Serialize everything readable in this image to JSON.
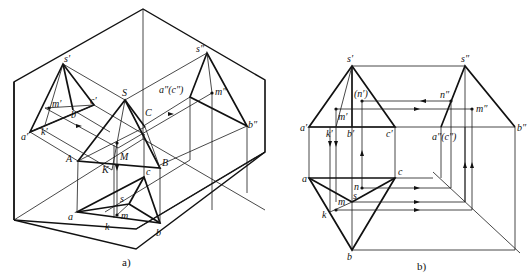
{
  "figure": {
    "panel_a": {
      "caption": "a)",
      "description": "Isometric view of three projection planes (V, H, W) with triangular pyramid SABC and its projections",
      "labels": {
        "s_prime": "s′",
        "s_double": "s″",
        "S": "S",
        "C": "C",
        "a_dbl_c_dbl": "a″(c″)",
        "m_prime": "m′",
        "c_prime": "c′",
        "b_prime": "b′",
        "a_prime": "a′",
        "k_prime": "k′",
        "m_double": "m″",
        "b_double": "b″",
        "A": "A",
        "M": "M",
        "K": "K",
        "B": "B",
        "c": "c",
        "s": "s",
        "a": "a",
        "k": "k",
        "m": "m",
        "b": "b"
      }
    },
    "panel_b": {
      "caption": "b)",
      "description": "Orthographic three-view projection of pyramid with point M and N constructions",
      "labels": {
        "s_prime": "s′",
        "s_double": "s″",
        "n_prime": "(n′)",
        "n_double": "n″",
        "m_prime": "m′",
        "m_double": "m″",
        "a_prime": "a′",
        "k_prime": "k′",
        "b_prime": "b′",
        "c_prime": "c′",
        "a_dbl_c_dbl": "a″(c″)",
        "b_double": "b″",
        "a": "a",
        "c": "c",
        "n": "n",
        "s": "s",
        "m": "m",
        "k": "k",
        "b": "b"
      }
    }
  }
}
